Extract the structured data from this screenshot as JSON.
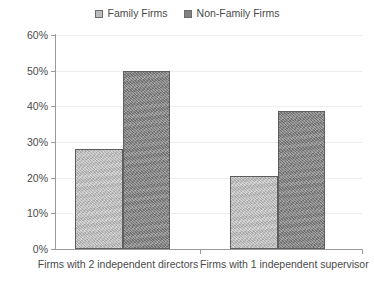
{
  "chart_data": {
    "type": "bar",
    "title": "",
    "subtitle": "",
    "xlabel": "",
    "ylabel": "",
    "categories": [
      "Firms with 2 independent directors",
      "Firms with 1 independent supervisor"
    ],
    "series": [
      {
        "name": "Family Firms",
        "color": "#bdbdbd",
        "values": [
          28.0,
          20.5
        ]
      },
      {
        "name": "Non-Family Firms",
        "color": "#828282",
        "values": [
          50.0,
          38.7
        ]
      }
    ],
    "ylim": [
      0,
      60
    ],
    "ytick_values": [
      0,
      10,
      20,
      30,
      40,
      50,
      60
    ],
    "ytick_labels": [
      "0%",
      "10%",
      "20%",
      "30%",
      "40%",
      "50%",
      "60%"
    ],
    "grid": true,
    "grid_axis": "y",
    "legend_position": "top-center",
    "annotations": []
  },
  "legend": {
    "entries": [
      {
        "label": "Family Firms"
      },
      {
        "label": "Non-Family Firms"
      }
    ]
  },
  "axis": {
    "y_labels": [
      "60%",
      "50%",
      "40%",
      "30%",
      "20%",
      "10%",
      "0%"
    ],
    "x_labels": [
      "Firms with 2 independent directors",
      "Firms with 1 independent supervisor"
    ]
  }
}
